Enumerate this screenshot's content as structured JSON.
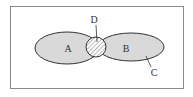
{
  "diagram": {
    "type": "venn",
    "sets": [
      {
        "id": "A",
        "label": "A"
      },
      {
        "id": "B",
        "label": "B"
      }
    ],
    "intersection_label": "D",
    "region_label": "C",
    "colors": {
      "frame": "#8a8a8a",
      "fill": "#d9d9d9",
      "stroke": "#333333",
      "hatch": "#777777"
    }
  }
}
